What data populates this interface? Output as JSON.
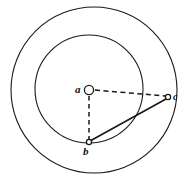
{
  "figure": {
    "background_color": "#ffffff",
    "stroke_color": "#1a1a1a",
    "width": 187,
    "height": 182,
    "labels": {
      "center_point": "a",
      "lower_point": "b",
      "right_point": "c"
    },
    "shapes": {
      "outer_circle": {
        "cx": 94,
        "cy": 90,
        "r": 83,
        "style": "solid"
      },
      "inner_circle": {
        "cx": 89,
        "cy": 89,
        "r": 54,
        "style": "solid"
      },
      "center_marker": {
        "cx": 89,
        "cy": 90,
        "r": 5,
        "style": "open"
      },
      "point_b_marker": {
        "cx": 89,
        "cy": 143,
        "r": 3,
        "style": "open"
      },
      "point_c_marker": {
        "cx": 168,
        "cy": 97,
        "r": 3,
        "style": "open"
      }
    },
    "lines": {
      "a_to_c": {
        "x1": 95,
        "y1": 90,
        "x2": 165,
        "y2": 96,
        "style": "dashed"
      },
      "a_to_b": {
        "x1": 89,
        "y1": 96,
        "x2": 89,
        "y2": 140,
        "style": "dashed"
      },
      "b_to_c": {
        "x1": 90,
        "y1": 141,
        "x2": 166,
        "y2": 99,
        "style": "solid"
      }
    }
  }
}
